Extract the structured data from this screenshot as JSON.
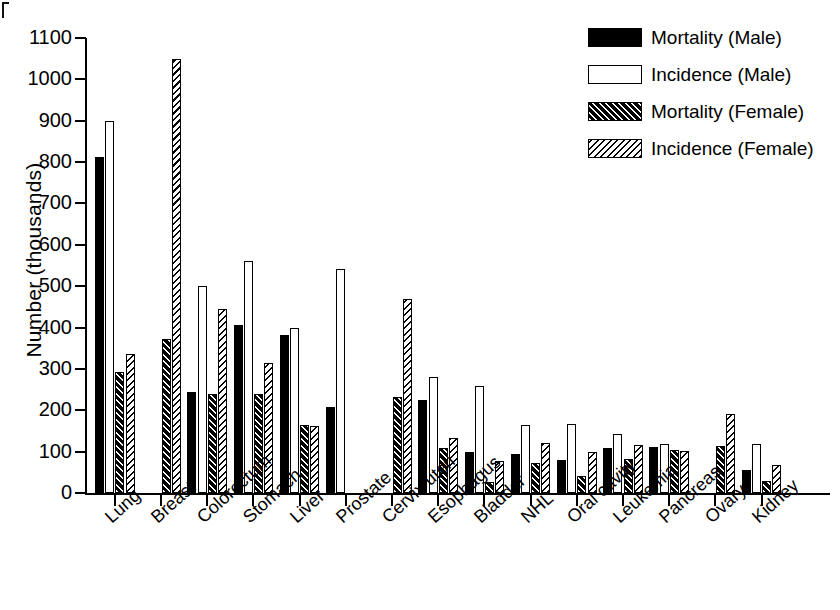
{
  "chart_data": {
    "type": "bar",
    "title": "",
    "xlabel": "",
    "ylabel": "Number  (thousands)",
    "ylim": [
      0,
      1100
    ],
    "yticks": [
      0,
      100,
      200,
      300,
      400,
      500,
      600,
      700,
      800,
      900,
      1000,
      1100
    ],
    "grid": false,
    "legend_position": "top-right",
    "categories": [
      "Lung",
      "Breast",
      "Colorectum",
      "Stomach",
      "Liver",
      "Prostate",
      "Cervix uteri",
      "Esophagus",
      "Bladder",
      "NHL",
      "Oral cavity",
      "Leukemia",
      "Pancreas",
      "Ovary",
      "Kidney"
    ],
    "series": [
      {
        "name": "Mortality (Male)",
        "fill": "solid-black",
        "values": [
          812,
          null,
          245,
          405,
          382,
          207,
          null,
          225,
          100,
          95,
          80,
          108,
          112,
          null,
          55
        ]
      },
      {
        "name": "Incidence (Male)",
        "fill": "white-outline",
        "values": [
          900,
          null,
          500,
          560,
          398,
          542,
          null,
          280,
          258,
          165,
          168,
          143,
          118,
          null,
          118
        ]
      },
      {
        "name": "Mortality (Female)",
        "fill": "black-with-white-hatch",
        "values": [
          292,
          372,
          240,
          240,
          165,
          null,
          233,
          110,
          27,
          72,
          40,
          83,
          105,
          113,
          30
        ]
      },
      {
        "name": "Incidence (Female)",
        "fill": "white-with-black-hatch",
        "values": [
          337,
          1050,
          445,
          315,
          162,
          null,
          470,
          132,
          78,
          120,
          98,
          115,
          102,
          190,
          68
        ]
      }
    ]
  },
  "legend": {
    "items": [
      {
        "label": "Mortality (Male)",
        "swatch": "f-mort-m"
      },
      {
        "label": "Incidence (Male)",
        "swatch": "f-inc-m"
      },
      {
        "label": "Mortality (Female)",
        "swatch": "f-mort-f"
      },
      {
        "label": "Incidence (Female)",
        "swatch": "f-inc-f"
      }
    ]
  },
  "colors": {
    "ink": "#000000",
    "paper": "#ffffff"
  }
}
